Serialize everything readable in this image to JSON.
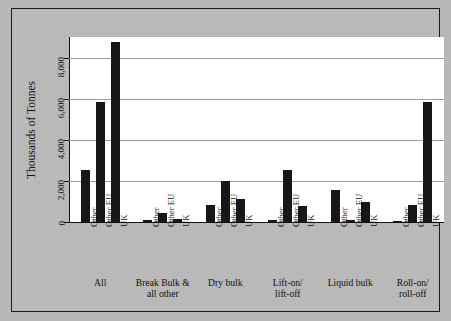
{
  "chart_data": {
    "type": "bar",
    "title": "",
    "subtitle": "",
    "xlabel": "",
    "ylabel": "Thousands of Tonnes",
    "ylim": [
      0,
      9000
    ],
    "yticks": [
      0,
      2000,
      4000,
      6000,
      8000
    ],
    "ytick_labels": [
      "0",
      "2,000",
      "4,000",
      "6,000",
      "8,000"
    ],
    "grid": true,
    "legend": "none",
    "categories": [
      "Other",
      "Other EU",
      "UK"
    ],
    "groups": [
      {
        "label_line1": "All",
        "label_line2": "",
        "values": [
          2550,
          5850,
          8750
        ]
      },
      {
        "label_line1": "Break Bulk &",
        "label_line2": "all other",
        "values": [
          120,
          430,
          150
        ]
      },
      {
        "label_line1": "Dry bulk",
        "label_line2": "",
        "values": [
          820,
          2000,
          1100
        ]
      },
      {
        "label_line1": "Lift-on/",
        "label_line2": "lift-off",
        "values": [
          90,
          2520,
          800
        ]
      },
      {
        "label_line1": "Liquid bulk",
        "label_line2": "",
        "values": [
          1550,
          90,
          950
        ]
      },
      {
        "label_line1": "Roll-on/",
        "label_line2": "roll-off",
        "values": [
          60,
          820,
          5850
        ]
      }
    ],
    "colors": {
      "bar": "#171717",
      "plot_background": "#ffffff",
      "figure_background": "#b9b9b9",
      "gridline": "#9a9a9a",
      "axis": "#111111",
      "frame_border": "#1a1a1a",
      "text": "#111111"
    }
  }
}
